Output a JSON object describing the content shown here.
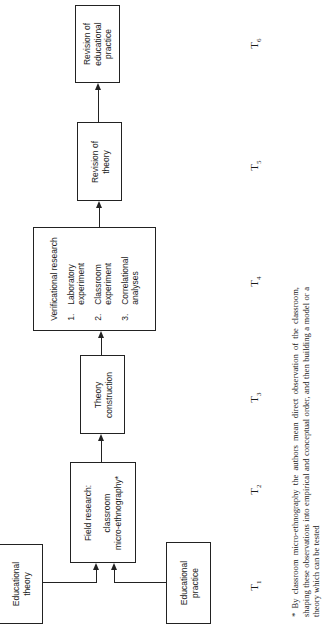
{
  "boxes": {
    "educational_theory": "Educational\ntheory",
    "educational_practice": "Educational\npractice",
    "field_research": {
      "title": "Field research:",
      "line1": "classroom",
      "line2": "micro-ethnography*"
    },
    "theory_construction": "Theory\nconstruction",
    "verificational_research": {
      "title": "Verificational research",
      "items": [
        {
          "num": "1.",
          "text": "Laboratory\nexperiment"
        },
        {
          "num": "2.",
          "text": "Classroom\nexperiment"
        },
        {
          "num": "3.",
          "text": "Correlational\nanalyses"
        }
      ]
    },
    "revision_of_theory": "Revision of\ntheory",
    "revision_of_practice": "Revision of\neducational\npractice"
  },
  "time_labels": [
    {
      "t": "T",
      "sub": "1"
    },
    {
      "t": "T",
      "sub": "2"
    },
    {
      "t": "T",
      "sub": "3"
    },
    {
      "t": "T",
      "sub": "4"
    },
    {
      "t": "T",
      "sub": "5"
    },
    {
      "t": "T",
      "sub": "6"
    }
  ],
  "footnote": "* By classroom micro-ethnography the authors mean direct observation of the classroom, shaping these observations into empirical and conceptual order, and then building a model or a theory which can be tested"
}
